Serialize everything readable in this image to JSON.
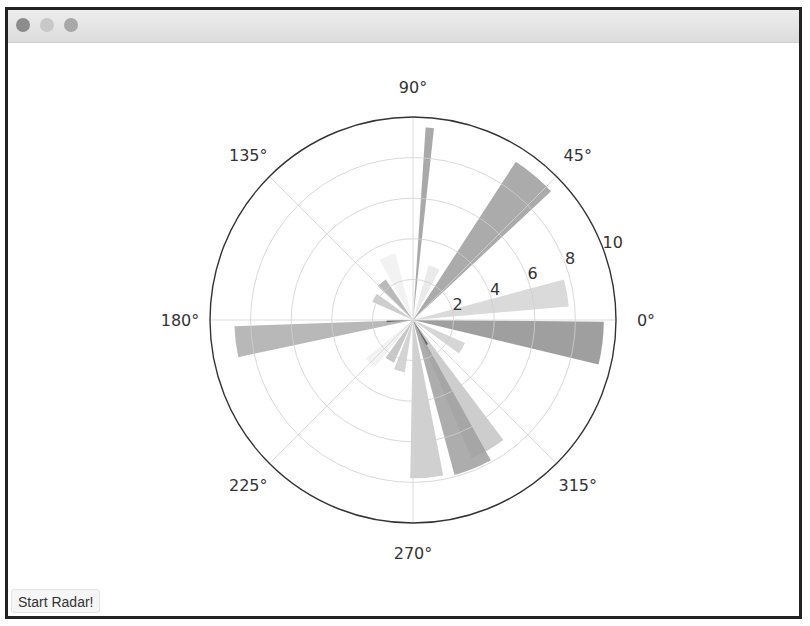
{
  "window": {
    "traffic_lights": [
      {
        "name": "close-button",
        "color": "#8c8c8c"
      },
      {
        "name": "minimize-button",
        "color": "#c8c8c8"
      },
      {
        "name": "zoom-button",
        "color": "#a8a8a8"
      }
    ]
  },
  "controls": {
    "start_label": "Start Radar!"
  },
  "chart_data": {
    "type": "bar",
    "projection": "polar",
    "title": "",
    "theta_tick_labels": [
      "0°",
      "45°",
      "90°",
      "135°",
      "180°",
      "225°",
      "270°",
      "315°"
    ],
    "theta_ticks_deg": [
      0,
      45,
      90,
      135,
      180,
      225,
      270,
      315
    ],
    "r_tick_labels": [
      "2",
      "4",
      "6",
      "8",
      "10"
    ],
    "r_ticks": [
      2,
      4,
      6,
      8,
      10
    ],
    "rlim": [
      0,
      10
    ],
    "r_label_angle_deg": 22.5,
    "grid": true,
    "bars": [
      {
        "theta_deg": 85,
        "width_deg": 2.5,
        "r": 9.5,
        "color": "#9a9a9a"
      },
      {
        "theta_deg": 50,
        "width_deg": 14,
        "r": 9.3,
        "color": "#9c9c9c"
      },
      {
        "theta_deg": 68,
        "width_deg": 12,
        "r": 2.8,
        "color": "#e6e6e6"
      },
      {
        "theta_deg": 10,
        "width_deg": 10,
        "r": 7.7,
        "color": "#d4d4d4"
      },
      {
        "theta_deg": 353,
        "width_deg": 13,
        "r": 9.4,
        "color": "#8e8e8e"
      },
      {
        "theta_deg": 330,
        "width_deg": 12,
        "r": 2.8,
        "color": "#cfcfcf"
      },
      {
        "theta_deg": 300,
        "width_deg": 14,
        "r": 7.4,
        "color": "#c4c4c4"
      },
      {
        "theta_deg": 292,
        "width_deg": 14,
        "r": 7.9,
        "color": "#9f9f9f"
      },
      {
        "theta_deg": 275,
        "width_deg": 12,
        "r": 7.8,
        "color": "#c8c8c8"
      },
      {
        "theta_deg": 255,
        "width_deg": 12,
        "r": 2.6,
        "color": "#cdcdcd"
      },
      {
        "theta_deg": 240,
        "width_deg": 12,
        "r": 2.3,
        "color": "#bdbdbd"
      },
      {
        "theta_deg": 225,
        "width_deg": 12,
        "r": 3.0,
        "color": "#f0f0f0"
      },
      {
        "theta_deg": 187,
        "width_deg": 10,
        "r": 8.8,
        "color": "#ababab"
      },
      {
        "theta_deg": 183,
        "width_deg": 4,
        "r": 1.3,
        "color": "#555555"
      },
      {
        "theta_deg": 150,
        "width_deg": 12,
        "r": 2.2,
        "color": "#c6c6c6"
      },
      {
        "theta_deg": 130,
        "width_deg": 12,
        "r": 2.4,
        "color": "#adadad"
      },
      {
        "theta_deg": 112,
        "width_deg": 14,
        "r": 3.4,
        "color": "#f0f0f0"
      },
      {
        "theta_deg": 300,
        "width_deg": 4,
        "r": 1.4,
        "color": "#5a5a5a"
      }
    ]
  }
}
